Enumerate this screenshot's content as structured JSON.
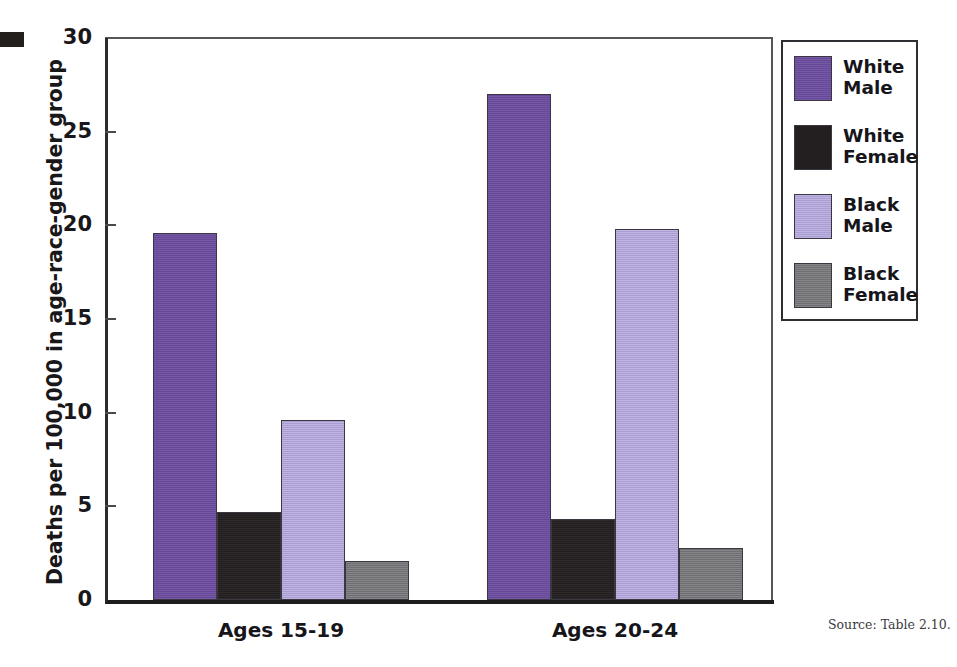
{
  "crop_mark": {
    "name": "printers-crop-mark"
  },
  "source_note": "Source: Table 2.10.",
  "axis": {
    "y_title": "Deaths per 100,000 in age-race-gender group",
    "y_ticks": [
      "30",
      "25",
      "20",
      "15",
      "10",
      "5",
      "0"
    ]
  },
  "legend": {
    "entries": [
      {
        "label_line1": "White",
        "label_line2": "Male",
        "color": "#6b4c9f"
      },
      {
        "label_line1": "White",
        "label_line2": "Female",
        "color": "#231f20"
      },
      {
        "label_line1": "Black",
        "label_line2": "Male",
        "color": "#b3a5dc"
      },
      {
        "label_line1": "Black",
        "label_line2": "Female",
        "color": "#77767a"
      }
    ]
  },
  "chart_data": {
    "type": "bar",
    "title": "",
    "xlabel": "",
    "ylabel": "Deaths per 100,000 in age-race-gender group",
    "ylim": [
      0,
      30
    ],
    "ytick_step": 5,
    "grid": false,
    "legend_position": "right",
    "categories": [
      "Ages 15-19",
      "Ages 20-24"
    ],
    "series": [
      {
        "name": "White Male",
        "color": "#6b4c9f",
        "values": [
          19.6,
          27.0
        ]
      },
      {
        "name": "White Female",
        "color": "#231f20",
        "values": [
          4.7,
          4.3
        ]
      },
      {
        "name": "Black Male",
        "color": "#b3a5dc",
        "values": [
          9.6,
          19.8
        ]
      },
      {
        "name": "Black Female",
        "color": "#77767a",
        "values": [
          2.1,
          2.8
        ]
      }
    ]
  }
}
